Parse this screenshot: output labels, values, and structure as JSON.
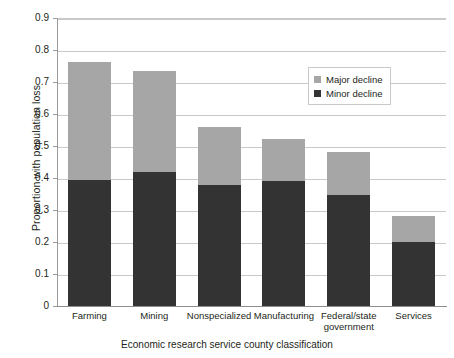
{
  "chart_data": {
    "type": "bar",
    "stacked": true,
    "title": "",
    "xlabel": "Economic research service county classification",
    "ylabel": "Proportion with population loss",
    "categories": [
      "Farming",
      "Mining",
      "Nonspecialized",
      "Manufacturing",
      "Federal/state government",
      "Services"
    ],
    "series": [
      {
        "name": "Minor decline",
        "color": "#333333",
        "values": [
          0.393,
          0.418,
          0.378,
          0.391,
          0.347,
          0.201
        ]
      },
      {
        "name": "Major decline",
        "color": "#a6a6a6",
        "values": [
          0.37,
          0.317,
          0.182,
          0.132,
          0.133,
          0.079
        ]
      }
    ],
    "totals": [
      0.763,
      0.735,
      0.56,
      0.523,
      0.48,
      0.28
    ],
    "ylim": [
      0,
      0.9
    ],
    "ytick_values": [
      0,
      0.1,
      0.2,
      0.3,
      0.4,
      0.5,
      0.6,
      0.7,
      0.8,
      0.9
    ],
    "ytick_labels": [
      "0",
      "0.1",
      "0.2",
      "0.3",
      "0.4",
      "0.5",
      "0.6",
      "0.7",
      "0.8",
      "0.9"
    ],
    "grid": "horizontal",
    "legend_position": "upper-right-inside",
    "legend": [
      {
        "label": "Major decline",
        "color": "#a6a6a6"
      },
      {
        "label": "Minor decline",
        "color": "#333333"
      }
    ]
  },
  "axes": {
    "y_title": "Proportion with population loss",
    "x_title": "Economic research service county classification"
  },
  "x_labels": [
    {
      "line1": "Farming",
      "line2": ""
    },
    {
      "line1": "Mining",
      "line2": ""
    },
    {
      "line1": "Nonspecialized",
      "line2": ""
    },
    {
      "line1": "Manufacturing",
      "line2": ""
    },
    {
      "line1": "Federal/state",
      "line2": "government"
    },
    {
      "line1": "Services",
      "line2": ""
    }
  ]
}
